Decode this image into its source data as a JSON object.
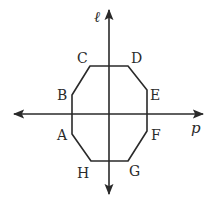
{
  "diagram": {
    "colors": {
      "stroke": "#2a2a2a",
      "background": "#ffffff"
    },
    "axes": {
      "vertical": {
        "label": "ℓ",
        "x": 109,
        "y1": 10,
        "y2": 194
      },
      "horizontal": {
        "label": "p",
        "y": 114,
        "x1": 14,
        "x2": 203
      }
    },
    "octagon": {
      "vertices": [
        {
          "name": "A",
          "x": 72,
          "y": 134
        },
        {
          "name": "B",
          "x": 72,
          "y": 95
        },
        {
          "name": "C",
          "x": 90,
          "y": 66
        },
        {
          "name": "D",
          "x": 128,
          "y": 66
        },
        {
          "name": "E",
          "x": 147,
          "y": 90
        },
        {
          "name": "F",
          "x": 147,
          "y": 131
        },
        {
          "name": "G",
          "x": 128,
          "y": 161
        },
        {
          "name": "H",
          "x": 91,
          "y": 161
        }
      ]
    },
    "labels": {
      "A": "A",
      "B": "B",
      "C": "C",
      "D": "D",
      "E": "E",
      "F": "F",
      "G": "G",
      "H": "H",
      "l": "ℓ",
      "p": "p"
    }
  }
}
